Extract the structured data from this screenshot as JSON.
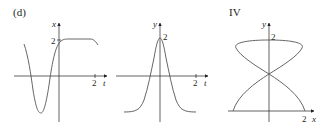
{
  "figure": {
    "panel_label": "(d)",
    "panels": [
      {
        "id": "x-vs-t",
        "vertical_axis_label": "x",
        "horizontal_axis_label": "t",
        "vertical_tick": "2",
        "horizontal_tick": "2"
      },
      {
        "id": "y-vs-t",
        "vertical_axis_label": "y",
        "horizontal_axis_label": "t",
        "vertical_tick": "2",
        "horizontal_tick": "2"
      },
      {
        "id": "parametric-IV",
        "title": "IV",
        "vertical_axis_label": "y",
        "horizontal_axis_label": "x",
        "vertical_tick": "2",
        "horizontal_tick": "2"
      }
    ]
  },
  "colors": {
    "ink": "#231f20",
    "curve": "#555555",
    "background": "#ffffff"
  }
}
